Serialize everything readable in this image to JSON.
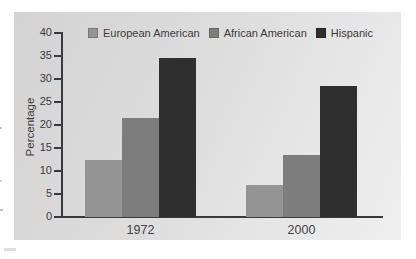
{
  "figure": {
    "background_color": "#fefefe",
    "panel_color_start": "#d3d3d3",
    "panel_color_end": "#efefef",
    "axis_color": "#3a3a3a",
    "text_color": "#3b3b3b"
  },
  "chart_data": {
    "type": "bar",
    "title": "",
    "categories": [
      "1972",
      "2000"
    ],
    "series": [
      {
        "name": "European American",
        "color": "#949494",
        "values": [
          12.5,
          7
        ]
      },
      {
        "name": "African American",
        "color": "#7d7d7d",
        "values": [
          21.5,
          13.5
        ]
      },
      {
        "name": "Hispanic",
        "color": "#2f2f2f",
        "values": [
          34.5,
          28.5
        ]
      }
    ],
    "xlabel": "",
    "ylabel": "Percentage",
    "ylim": [
      0,
      40
    ],
    "ytick_step": 5,
    "yticks": [
      0,
      5,
      10,
      15,
      20,
      25,
      30,
      35,
      40
    ],
    "legend_position": "top",
    "grid": false
  }
}
